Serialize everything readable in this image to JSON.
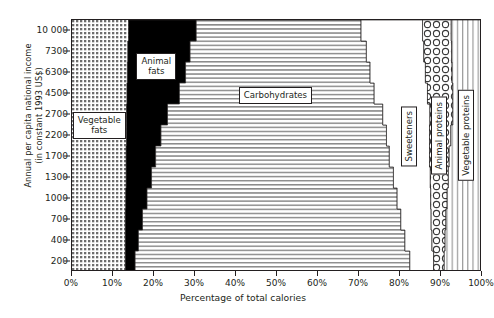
{
  "chart_data": {
    "type": "area",
    "title": "",
    "subtitle": "",
    "xlabel": "Percentage of total calories",
    "ylabel": "Annual per capita national income\n(in constant 1993 US$)",
    "xlim": [
      0,
      100
    ],
    "xtick_labels": [
      "0%",
      "10%",
      "20%",
      "30%",
      "40%",
      "50%",
      "60%",
      "70%",
      "80%",
      "90%",
      "100%"
    ],
    "xtick_values": [
      0,
      10,
      20,
      30,
      40,
      50,
      60,
      70,
      80,
      90,
      100
    ],
    "ytick_labels": [
      "10 000",
      "7300",
      "6300",
      "4500",
      "2700",
      "2200",
      "1700",
      "1300",
      "1000",
      "700",
      "400",
      "200"
    ],
    "ytick_values": [
      10000,
      7300,
      6300,
      4500,
      2700,
      2200,
      1700,
      1300,
      1000,
      700,
      400,
      200
    ],
    "y_axis_scale": "ordinal-income-bands",
    "grid": false,
    "legend_position": "inline-callouts",
    "stacking": "percent",
    "orientation": "horizontal",
    "series": [
      {
        "name": "Vegetable fats",
        "pattern": "fine-dotted-grid",
        "color": "#d9d9d9",
        "values": [
          13.8,
          13.6,
          13.5,
          13.4,
          13.3,
          13.3,
          13.2,
          13.2,
          13.1,
          13.0,
          13.0,
          13.0
        ]
      },
      {
        "name": "Animal fats",
        "pattern": "solid-black",
        "color": "#000000",
        "values": [
          16.5,
          15.2,
          14.2,
          12.8,
          10.0,
          8.4,
          7.2,
          6.2,
          5.2,
          4.2,
          3.2,
          2.4
        ]
      },
      {
        "name": "Carbohydrates",
        "pattern": "horizontal-lines",
        "color": "#ffffff",
        "values": [
          40.2,
          43.0,
          45.0,
          47.5,
          52.5,
          55.0,
          57.0,
          59.0,
          61.0,
          63.0,
          65.0,
          67.0
        ]
      },
      {
        "name": "Sweeteners",
        "pattern": "solid-white",
        "color": "#ffffff",
        "values": [
          15.0,
          14.0,
          13.5,
          13.0,
          11.5,
          10.5,
          9.8,
          9.0,
          8.2,
          7.4,
          6.6,
          5.8
        ]
      },
      {
        "name": "Animal proteins",
        "pattern": "circles",
        "color": "#ffffff",
        "values": [
          7.0,
          6.8,
          6.5,
          6.2,
          5.6,
          5.2,
          4.8,
          4.4,
          4.0,
          3.6,
          3.2,
          2.6
        ]
      },
      {
        "name": "Vegetable proteins",
        "pattern": "vertical-lines",
        "color": "#ffffff",
        "values": [
          7.5,
          7.4,
          7.3,
          7.1,
          7.1,
          7.6,
          8.0,
          8.2,
          8.5,
          8.8,
          9.0,
          9.2
        ]
      }
    ],
    "callouts": [
      {
        "label": "Vegetable\nfats",
        "orientation": "horizontal"
      },
      {
        "label": "Animal\nfats",
        "orientation": "horizontal"
      },
      {
        "label": "Carbohydrates",
        "orientation": "horizontal"
      },
      {
        "label": "Sweeteners",
        "orientation": "vertical"
      },
      {
        "label": "Animal proteins",
        "orientation": "vertical"
      },
      {
        "label": "Vegetable proteins",
        "orientation": "vertical"
      }
    ]
  }
}
